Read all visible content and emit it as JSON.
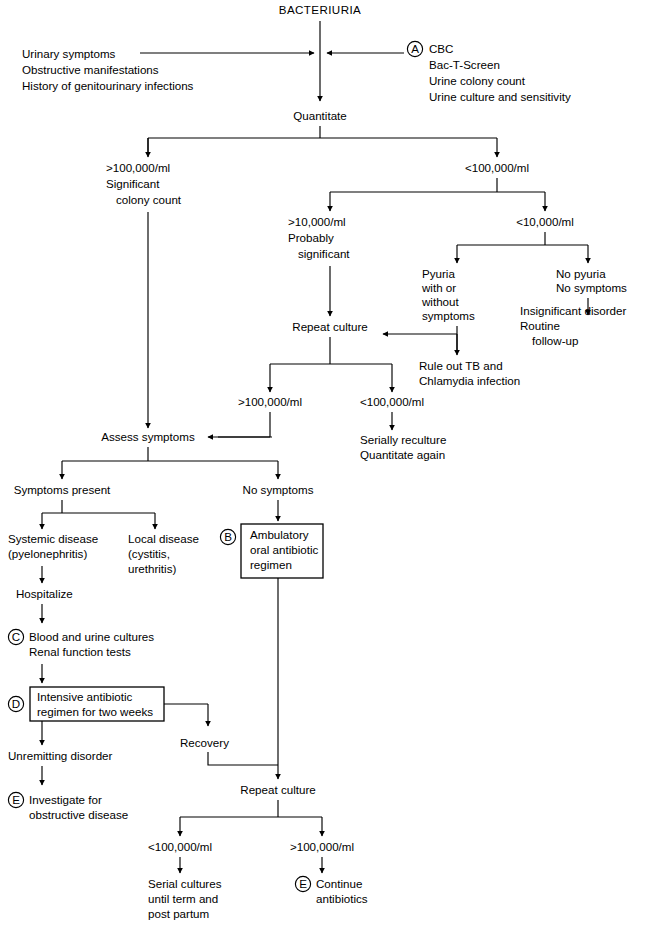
{
  "diagram": {
    "title": "BACTERIURIA",
    "type": "clinical-algorithm-flowchart",
    "nodes": {
      "root": "BACTERIURIA",
      "left_inputs": [
        "Urinary symptoms",
        "Obstructive manifestations",
        "History of genitourinary infections"
      ],
      "right_inputs": [
        "CBC",
        "Bac-T-Screen",
        "Urine colony count",
        "Urine culture and sensitivity"
      ],
      "right_inputs_key": "A",
      "quantitate": "Quantitate",
      "high_count_line1": ">100,000/ml",
      "high_count_line2": "Significant",
      "high_count_line3": "colony count",
      "low_count": "<100,000/ml",
      "mid_count_line1": ">10,000/ml",
      "mid_count_line2": "Probably",
      "mid_count_line3": "significant",
      "very_low_count": "<10,000/ml",
      "pyuria_line1": "Pyuria",
      "pyuria_line2": "with or",
      "pyuria_line3": "without",
      "pyuria_line4": "symptoms",
      "no_pyuria_line1": "No pyuria",
      "no_pyuria_line2": "No symptoms",
      "insignificant_line1": "Insignificant disorder",
      "insignificant_line2": "Routine",
      "insignificant_line3": "follow-up",
      "repeat_culture_1": "Repeat culture",
      "rule_out_line1": "Rule out TB and",
      "rule_out_line2": "Chlamydia infection",
      "rc_high": ">100,000/ml",
      "rc_low": "<100,000/ml",
      "serially_line1": "Serially reculture",
      "serially_line2": "Quantitate again",
      "assess_symptoms": "Assess symptoms",
      "symptoms_present": "Symptoms present",
      "no_symptoms": "No symptoms",
      "systemic_line1": "Systemic disease",
      "systemic_line2": "(pyelonephritis)",
      "local_line1": "Local disease",
      "local_line2": "(cystitis,",
      "local_line3": "urethritis)",
      "ambulatory_key": "B",
      "ambulatory_line1": "Ambulatory",
      "ambulatory_line2": "oral antibiotic",
      "ambulatory_line3": "regimen",
      "hospitalize": "Hospitalize",
      "cultures_key": "C",
      "cultures_line1": "Blood and urine cultures",
      "cultures_line2": "Renal function tests",
      "intensive_key": "D",
      "intensive_line1": "Intensive antibiotic",
      "intensive_line2": "regimen for two weeks",
      "recovery": "Recovery",
      "unremitting": "Unremitting disorder",
      "investigate_key": "E",
      "investigate_line1": "Investigate for",
      "investigate_line2": "obstructive disease",
      "repeat_culture_2": "Repeat culture",
      "final_low": "<100,000/ml",
      "final_high": ">100,000/ml",
      "serial_line1": "Serial cultures",
      "serial_line2": "until term and",
      "serial_line3": "post partum",
      "continue_key": "E",
      "continue_line1": "Continue",
      "continue_line2": "antibiotics"
    },
    "colors": {
      "line": "#000000",
      "text": "#000000",
      "background": "#ffffff"
    }
  }
}
